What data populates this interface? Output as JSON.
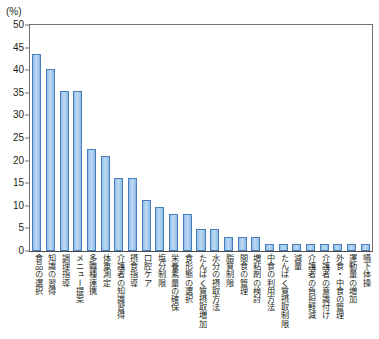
{
  "chart_data": {
    "type": "bar",
    "title": "",
    "subtitle": "",
    "xlabel": "",
    "ylabel": "(%)",
    "unit_label": "(%)",
    "annotation": "(n=62)",
    "annotation_symbol": "n",
    "annotation_value": "=62)",
    "annotation_prefix": "(",
    "sample_size": 62,
    "ylim": [
      0,
      50
    ],
    "yticks": [
      50,
      45,
      40,
      35,
      30,
      25,
      20,
      15,
      10,
      5,
      0
    ],
    "ytick_labels": [
      "50",
      "45",
      "40",
      "35",
      "30",
      "25",
      "20",
      "15",
      "10",
      "5",
      "0"
    ],
    "grid": false,
    "legend": "none",
    "bar_color": "#a9cdee",
    "bar_edge_color": "#4a7ebb",
    "axis_color": "#6f6f6f",
    "categories": [
      "食品の選択",
      "知識の習得",
      "調理指導",
      "メニュー提案",
      "多職種連携",
      "体重測定",
      "介護者の知識習得",
      "摂食指導",
      "口腔ケア",
      "塩分制限",
      "栄養素量の確保",
      "食形態の選択",
      "たんぱく質摂取増加",
      "水分の摂取方法",
      "脂質制限",
      "間食の管理",
      "増粘剤の検討",
      "中食の利用方法",
      "たんぱく質摂取制限",
      "減量",
      "介護者の負担軽減",
      "介護者の意識付け",
      "外食・中食の管理",
      "運動量の増加",
      "嚥下体操"
    ],
    "values": [
      43.5,
      40.3,
      35.4,
      35.4,
      22.5,
      21.0,
      16.1,
      16.1,
      11.3,
      9.7,
      8.1,
      8.1,
      4.8,
      4.8,
      3.2,
      3.2,
      3.2,
      1.6,
      1.6,
      1.6,
      1.6,
      1.6,
      1.6,
      1.6,
      1.6
    ]
  }
}
